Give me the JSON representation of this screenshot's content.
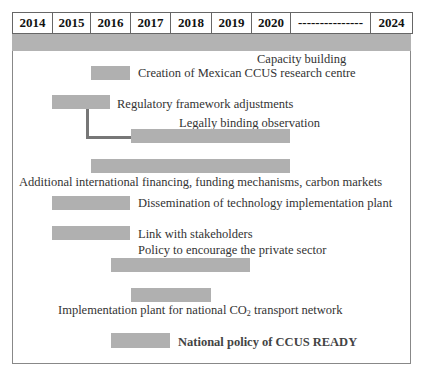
{
  "timeline": {
    "columns": [
      {
        "label": "2014",
        "width": 40
      },
      {
        "label": "2015",
        "width": 38
      },
      {
        "label": "2016",
        "width": 40
      },
      {
        "label": "2017",
        "width": 40
      },
      {
        "label": "2018",
        "width": 41
      },
      {
        "label": "2019",
        "width": 40
      },
      {
        "label": "2020",
        "width": 39
      },
      {
        "label": "---------------",
        "width": 80
      },
      {
        "label": "2024",
        "width": 41
      }
    ],
    "band_color": "#b3b3b3",
    "bar_color": "#b0b0b0"
  },
  "items": [
    {
      "label": "Capacity building"
    },
    {
      "label": "Creation of Mexican CCUS research centre",
      "start": "2016",
      "end": "2017"
    },
    {
      "label": "Regulatory framework adjustments",
      "start": "2015",
      "end": "2016"
    },
    {
      "label": "Legally binding observation",
      "start": "2017",
      "end": "2020"
    },
    {
      "label": "Additional international financing, funding mechanisms, carbon markets",
      "start": "2016",
      "end": "2020"
    },
    {
      "label": "Dissemination of technology implementation plant",
      "start": "2015",
      "end": "2017"
    },
    {
      "label": "Link with stakeholders",
      "start": "2015",
      "end": "2017"
    },
    {
      "label": "Policy to encourage the private sector",
      "start": "2016",
      "end": "2019"
    },
    {
      "label_main": "Implementation plant for national CO",
      "label_sub": "2",
      "label_rest": " transport network",
      "start": "2017",
      "end": "2018"
    },
    {
      "label": "National policy of CCUS READY",
      "start": "2016",
      "end": "2017"
    }
  ]
}
